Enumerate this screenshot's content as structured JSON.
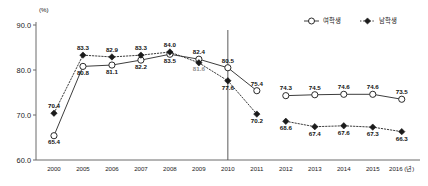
{
  "chart_data": {
    "type": "line",
    "title": "",
    "xlabel": "",
    "ylabel": "",
    "unit_label": "(%)",
    "x_axis_unit": "(년)",
    "ylim": [
      60.0,
      90.0
    ],
    "yticks": [
      "90.0",
      "80.0",
      "70.0",
      "60.0"
    ],
    "ytick_values": [
      90.0,
      80.0,
      70.0,
      60.0
    ],
    "grid": false,
    "legend_position": "top-right",
    "categories": [
      "2000",
      "2005",
      "2006",
      "2007",
      "2008",
      "2009",
      "2010",
      "2011",
      "2012",
      "2013",
      "2014",
      "2015",
      "2016"
    ],
    "break_after_category": "2010",
    "series": [
      {
        "name": "여학생",
        "marker": "hollow-circle",
        "line_style": "solid",
        "values": [
          65.4,
          80.8,
          81.1,
          82.2,
          83.5,
          82.4,
          80.5,
          75.4,
          74.3,
          74.5,
          74.6,
          74.6,
          73.5
        ]
      },
      {
        "name": "남학생",
        "marker": "filled-diamond",
        "line_style": "dotted",
        "values": [
          70.4,
          83.3,
          82.9,
          83.3,
          84.0,
          81.6,
          77.6,
          70.2,
          68.6,
          67.4,
          67.6,
          67.3,
          66.3
        ]
      }
    ]
  },
  "legend": {
    "items": [
      {
        "label": "여학생",
        "marker": "hollow-circle",
        "line_style": "solid"
      },
      {
        "label": "남학생",
        "marker": "filled-diamond",
        "line_style": "dotted"
      }
    ]
  },
  "colors": {
    "axis": "#6b6b6b",
    "line": "#3d3d3d",
    "marker_fill_female": "#ffffff",
    "marker_fill_male": "#1b1b1b",
    "label_text": "#111111",
    "label_text_faint": "#8d8d8d",
    "background": "#ffffff"
  }
}
